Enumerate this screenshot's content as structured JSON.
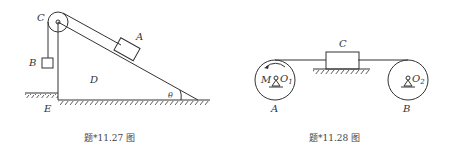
{
  "figures": [
    {
      "id": "fig-11-27",
      "caption": "题*11.27 图",
      "labels": {
        "pulley": "C",
        "block_on_incline": "A",
        "hanging_block": "B",
        "wedge": "D",
        "corner": "E",
        "angle": "θ"
      }
    },
    {
      "id": "fig-11-28",
      "caption": "题*11.28 图",
      "labels": {
        "block": "C",
        "left_wheel": "A",
        "right_wheel": "B",
        "torque": "M",
        "left_axle": "O",
        "left_axle_sub": "1",
        "right_axle": "O",
        "right_axle_sub": "2"
      }
    }
  ],
  "colors": {
    "line": "#333333",
    "background": "#ffffff"
  }
}
